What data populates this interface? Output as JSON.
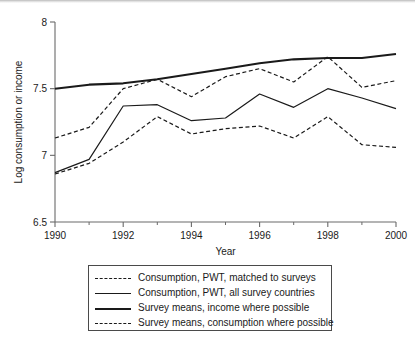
{
  "chart_data": {
    "type": "line",
    "title": "",
    "xlabel": "Year",
    "ylabel": "Log consumption or income",
    "x": [
      1990,
      1991,
      1992,
      1993,
      1994,
      1995,
      1996,
      1997,
      1998,
      1999,
      2000
    ],
    "xlim": [
      1990,
      2000
    ],
    "ylim": [
      6.5,
      8.0
    ],
    "xticks": [
      1990,
      1992,
      1994,
      1996,
      1998,
      2000
    ],
    "xtick_labels": [
      "1990",
      "1992",
      "1994",
      "1996",
      "1998",
      "2000"
    ],
    "xminor_ticks": [
      1991,
      1993,
      1995,
      1997,
      1999
    ],
    "yticks": [
      6.5,
      7,
      7.5,
      8
    ],
    "ytick_labels": [
      "6.5",
      "7",
      "7.5",
      "8"
    ],
    "grid": false,
    "legend_position": "below",
    "series": [
      {
        "name": "Consumption, PWT, matched to surveys",
        "style": "dashed",
        "width": "thin",
        "color": "#1a1a1a",
        "values": [
          7.13,
          7.21,
          7.5,
          7.57,
          7.44,
          7.59,
          7.65,
          7.55,
          7.74,
          7.51,
          7.56
        ]
      },
      {
        "name": "Consumption, PWT, all survey countries",
        "style": "solid",
        "width": "thin",
        "color": "#1a1a1a",
        "values": [
          6.87,
          6.97,
          7.37,
          7.38,
          7.26,
          7.28,
          7.46,
          7.36,
          7.5,
          7.43,
          7.35
        ]
      },
      {
        "name": "Survey means, income where possible",
        "style": "solid",
        "width": "thick",
        "color": "#1a1a1a",
        "values": [
          7.5,
          7.53,
          7.54,
          7.57,
          7.61,
          7.65,
          7.69,
          7.72,
          7.73,
          7.73,
          7.76
        ]
      },
      {
        "name": "Survey means, consumption where possible",
        "style": "dashed",
        "width": "thin",
        "color": "#1a1a1a",
        "values": [
          6.86,
          6.94,
          7.1,
          7.29,
          7.16,
          7.2,
          7.22,
          7.13,
          7.29,
          7.08,
          7.06
        ]
      }
    ]
  },
  "legend": {
    "items": [
      {
        "label": "Consumption, PWT, matched to surveys",
        "swatch": "dashed-thin"
      },
      {
        "label": "Consumption, PWT, all survey countries",
        "swatch": "solid-thin"
      },
      {
        "label": "Survey means, income where possible",
        "swatch": "solid-thick"
      },
      {
        "label": "Survey means, consumption where possible",
        "swatch": "dashed-thin"
      }
    ]
  }
}
